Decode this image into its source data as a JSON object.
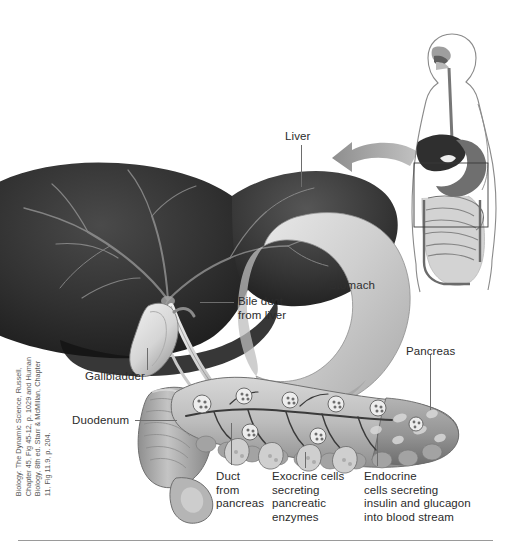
{
  "figure": {
    "background_color": "#ffffff",
    "label_color": "#2b2b2b",
    "leader_color": "#6d6d6d",
    "rule_color": "#9a9a9a"
  },
  "labels": {
    "liver": "Liver",
    "bile_duct": "Bile duct\nfrom liver",
    "gallbladder": "Gallbladder",
    "duodenum": "Duodenum",
    "stomach": "Stomach",
    "pancreas": "Pancreas",
    "duct_from_pancreas": "Duct\nfrom\npancreas",
    "exocrine": "Exocrine cells\nsecreting\npancreatic\nenzymes",
    "endocrine": "Endocrine\ncells secreting\ninsulin and glucagon\ninto blood stream"
  },
  "inset": {
    "name": "human-body-digestive-tract-inset",
    "description": "Outline of human torso with digestive tract; rectangle marks abdominal region"
  },
  "arrow": {
    "name": "magnify-arrow",
    "direction": "left",
    "color": "#9d9d9d"
  },
  "credit": {
    "text": "Biology: The Dynamic Science, Russell,\nChapter 45, Fig 45-12, p. 1029 and Human\nBiology, 8th ed. Starr & McMillan, Chapter\n11, Fig 11.9, p. 204."
  },
  "colors": {
    "liver_dark": "#2a2a2a",
    "liver_mid": "#3c3c3c",
    "vessel": "#8c8c8c",
    "stomach": "#c9c9c9",
    "gallbladder": "#e2e2e2",
    "pancreas": "#bdbdbd",
    "duodenum": "#a8a8a8"
  }
}
